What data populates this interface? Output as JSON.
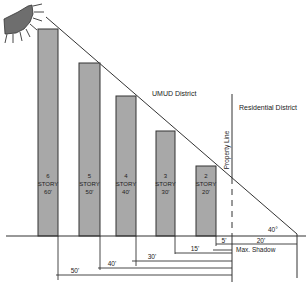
{
  "labels": {
    "district_left": "UMUD District",
    "district_right": "Residential District",
    "property_line": "Property Line",
    "max_shadow": "Max. Shadow",
    "angle": "40°"
  },
  "buildings": [
    {
      "stories": "6",
      "word": "STORY",
      "height": "60'"
    },
    {
      "stories": "5",
      "word": "STORY",
      "height": "50'"
    },
    {
      "stories": "4",
      "word": "STORY",
      "height": "40'"
    },
    {
      "stories": "3",
      "word": "STORY",
      "height": "30'"
    },
    {
      "stories": "2",
      "word": "STORY",
      "height": "20'"
    }
  ],
  "setbacks": {
    "d50": "50'",
    "d40": "40'",
    "d30": "30'",
    "d15": "15'",
    "d5": "5'",
    "d20": "20'"
  },
  "colors": {
    "bar_fill": "#a8a8a8",
    "bar_stroke": "#333333",
    "sun_fill": "#6e6e6e",
    "line": "#333333"
  }
}
